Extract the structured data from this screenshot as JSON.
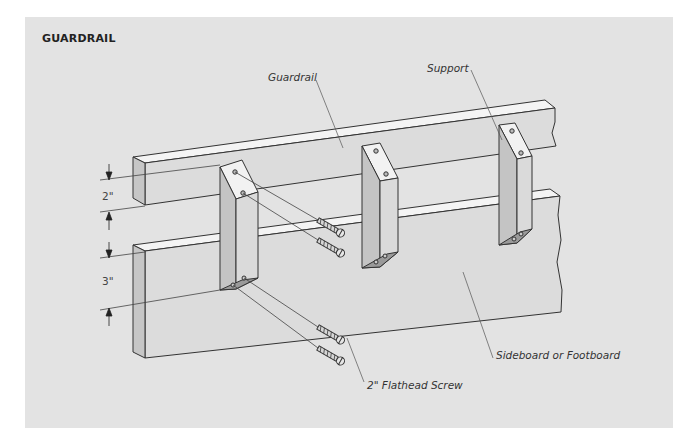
{
  "title": "GUARDRAIL",
  "labels": {
    "guardrail": "Guardrail",
    "support": "Support",
    "sideboard": "Sideboard or Footboard",
    "screw": "2\" Flathead Screw"
  },
  "dimensions": {
    "gap": "2\"",
    "rail_height": "3\""
  },
  "colors": {
    "panel": "#e3e3e3",
    "wood_front": "#dcdcdc",
    "wood_top": "#f4f4f4",
    "wood_side": "#c8c8c8",
    "line": "#333333"
  }
}
